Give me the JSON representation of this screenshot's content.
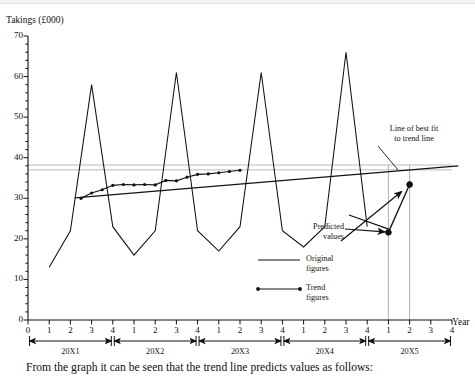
{
  "page": {
    "caption": "From the graph it can be seen that the trend line predicts values as follows:"
  },
  "chart_data": {
    "type": "line",
    "title": "",
    "ylabel": "Takings (£000)",
    "xlabel": "Year",
    "ylim": [
      0,
      70
    ],
    "ytick_labels": [
      "0",
      "10",
      "20",
      "30",
      "40",
      "50",
      "60",
      "70"
    ],
    "ytick_values": [
      0,
      10,
      20,
      30,
      40,
      50,
      60,
      70
    ],
    "yminor_step": 2,
    "grid": false,
    "xlim": [
      0,
      21
    ],
    "xtick_labels": [
      "0",
      "1",
      "2",
      "3",
      "4",
      "1",
      "2",
      "3",
      "4",
      "1",
      "2",
      "3",
      "4",
      "1",
      "2",
      "3",
      "4",
      "1",
      "2",
      "3",
      "4"
    ],
    "x_quarter_index": [
      0,
      1,
      2,
      3,
      4,
      5,
      6,
      7,
      8,
      9,
      10,
      11,
      12,
      13,
      14,
      15,
      16,
      17,
      18,
      19,
      20
    ],
    "year_groups": [
      {
        "label": "20X1",
        "start": 1,
        "end": 4
      },
      {
        "label": "20X2",
        "start": 5,
        "end": 8
      },
      {
        "label": "20X3",
        "start": 9,
        "end": 12
      },
      {
        "label": "20X4",
        "start": 13,
        "end": 16
      },
      {
        "label": "20X5",
        "start": 17,
        "end": 20
      }
    ],
    "legend_position": "inside-lower-right",
    "series": [
      {
        "name": "Original figures",
        "style": "line",
        "x": [
          1,
          2,
          3,
          4,
          5,
          6,
          7,
          8,
          9,
          10,
          11,
          12,
          13,
          14,
          15,
          16
        ],
        "values": [
          13,
          22,
          58,
          23,
          16,
          22,
          61,
          22,
          17,
          23,
          61,
          22,
          18,
          23,
          66,
          23
        ]
      },
      {
        "name": "Trend figures",
        "style": "line-with-markers",
        "x": [
          2.5,
          3,
          3.5,
          4,
          4.5,
          5,
          5.5,
          6,
          6.5,
          7,
          7.5,
          8,
          8.5,
          9,
          9.5,
          10
        ],
        "values": [
          30.0,
          31.3,
          32.1,
          33.2,
          33.4,
          33.3,
          33.4,
          33.3,
          34.4,
          34.3,
          35.2,
          35.9,
          36.0,
          36.3,
          36.6,
          36.9
        ]
      }
    ],
    "best_fit_line": {
      "name": "Line of best fit to trend line",
      "x_start": 2.2,
      "y_start": 30.1,
      "x_end": 20.3,
      "y_end": 38.0
    },
    "reference_lines": [
      {
        "value": 38.2,
        "color": "#b9b9b9"
      },
      {
        "value": 37.0,
        "color": "#b9b9b9"
      }
    ],
    "predicted_points": [
      {
        "x": 17,
        "y": 21.6,
        "label": "Q1 20X5"
      },
      {
        "x": 18,
        "y": 33.4,
        "label": "Q2 20X5"
      }
    ],
    "projection_guides": [
      {
        "x": 17,
        "color": "#a8a8a8"
      },
      {
        "x": 18,
        "color": "#a8a8a8"
      }
    ],
    "annotations": [
      {
        "name": "best-fit-annotation",
        "line1": "Line of best fit",
        "line2": "to trend line"
      },
      {
        "name": "predicted-values-annotation",
        "line1": "Predicted",
        "line2": "values"
      }
    ],
    "legend": [
      {
        "label_line1": "Original",
        "label_line2": "figures",
        "marker": "plain-line"
      },
      {
        "label_line1": "Trend",
        "label_line2": "figures",
        "marker": "dotted-end-line"
      }
    ],
    "colors": {
      "ink": "#111111",
      "axis": "#111111",
      "reference": "#b9b9b9",
      "guide": "#a8a8a8",
      "background": "#ffffff"
    }
  }
}
